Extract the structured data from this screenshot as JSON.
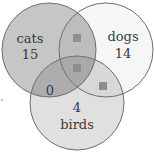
{
  "diagram": {
    "type": "venn-3",
    "sets": [
      {
        "id": "cats",
        "label": "cats",
        "only_count": "15",
        "cx": 49,
        "cy": 50,
        "r": 47
      },
      {
        "id": "dogs",
        "label": "dogs",
        "only_count": "14",
        "cx": 106,
        "cy": 50,
        "r": 47
      },
      {
        "id": "birds",
        "label": "birds",
        "only_count": "4",
        "cx": 77,
        "cy": 103,
        "r": 47
      }
    ],
    "regions": {
      "cats_only": "15",
      "dogs_only": "14",
      "birds_only": "4",
      "cats_birds_only": "0",
      "cats_dogs_only": "unknown (shaded square)",
      "dogs_birds_only": "unknown (shaded square)",
      "cats_dogs_birds": "unknown (shaded square)"
    },
    "labels": {
      "cats": "cats",
      "cats_count": "15",
      "dogs": "dogs",
      "dogs_count": "14",
      "birds": "birds",
      "birds_count": "4",
      "cats_birds_count": "0"
    },
    "colors": {
      "cats_fill": "#c6c6c6",
      "dogs_fill": "#f6f6f6",
      "birds_fill": "#e0e0e0",
      "outline": "#6e6e6e",
      "square": "#8e8e8e",
      "text": "#3a3a3a"
    }
  }
}
